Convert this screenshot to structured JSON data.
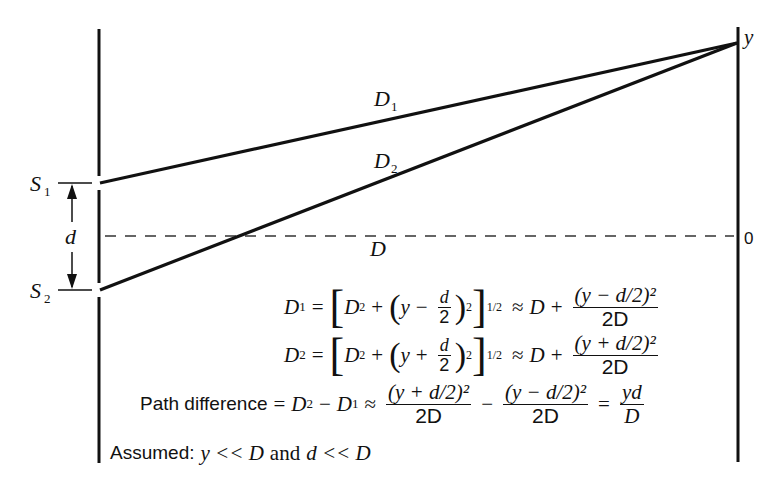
{
  "diagram": {
    "labels": {
      "screen_point": "y",
      "screen_origin": "0",
      "slit1": "S",
      "slit1_sub": "1",
      "slit2": "S",
      "slit2_sub": "2",
      "slit_separation": "d",
      "path1": "D",
      "path1_sub": "1",
      "path2": "D",
      "path2_sub": "2",
      "distance": "D"
    },
    "equations": {
      "eq1": {
        "lhs": "D",
        "lhs_sub": "1",
        "eq": "=",
        "open": "[",
        "D": "D",
        "D_sup": "2",
        "plus": "+",
        "paren_open": "(",
        "y": "y",
        "sign": "−",
        "frac_num": "d",
        "frac_den": "2",
        "paren_close": ")",
        "paren_sup": "2",
        "close": "]",
        "close_sup": "1/2",
        "approx": "≈",
        "rhs_D": "D",
        "rhs_plus": "+",
        "rhs_num": "(y − d/2)²",
        "rhs_den": "2D"
      },
      "eq2": {
        "lhs": "D",
        "lhs_sub": "2",
        "eq": "=",
        "open": "[",
        "D": "D",
        "D_sup": "2",
        "plus": "+",
        "paren_open": "(",
        "y": "y",
        "sign": "+",
        "frac_num": "d",
        "frac_den": "2",
        "paren_close": ")",
        "paren_sup": "2",
        "close": "]",
        "close_sup": "1/2",
        "approx": "≈",
        "rhs_D": "D",
        "rhs_plus": "+",
        "rhs_num": "(y + d/2)²",
        "rhs_den": "2D"
      },
      "path_difference": {
        "label": "Path difference",
        "eq": "=",
        "term1": "D",
        "term1_sub": "2",
        "minus": "−",
        "term2": "D",
        "term2_sub": "1",
        "approx": "≈",
        "frac1_num": "(y + d/2)²",
        "frac1_den": "2D",
        "minus2": "−",
        "frac2_num": "(y − d/2)²",
        "frac2_den": "2D",
        "eq2": "=",
        "result_num": "yd",
        "result_den": "D"
      },
      "assumption": {
        "label": "Assumed:",
        "cond1": "y << D",
        "and": "and",
        "cond2": "d << D"
      }
    },
    "colors": {
      "ink": "#111111",
      "dashed": "#333333",
      "background": "#ffffff"
    }
  }
}
